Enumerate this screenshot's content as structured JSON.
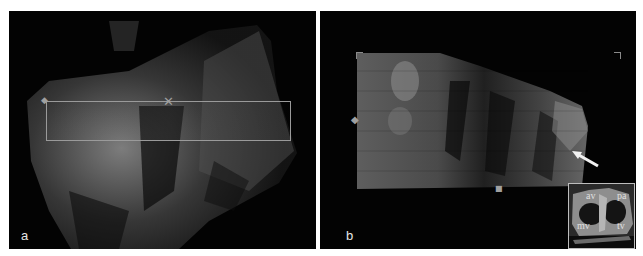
{
  "figure": {
    "panels": [
      {
        "id": "a",
        "label": "a",
        "description": "3D ultrasound volume, grayscale, with rectangular region-of-interest box and crosshair marker",
        "roi_box": {
          "x": 38,
          "y": 90,
          "width": 244,
          "height": 40
        },
        "markers": [
          "x-crosshair",
          "left-diamond"
        ]
      },
      {
        "id": "b",
        "label": "b",
        "description": "Rendered 3D view of the ROI with arrow annotation",
        "markers": [
          "left-diamond",
          "bottom-square",
          "corner-brackets"
        ],
        "arrow": "white-arrow",
        "inset": {
          "labels": {
            "top_left": "av",
            "top_right": "pa",
            "bottom_left": "mv",
            "bottom_right": "tv"
          }
        }
      }
    ],
    "colors": {
      "background": "#ffffff",
      "panel_bg": "#030303",
      "roi_box": "#9a9a9a",
      "label": "#e6e6e6"
    }
  }
}
